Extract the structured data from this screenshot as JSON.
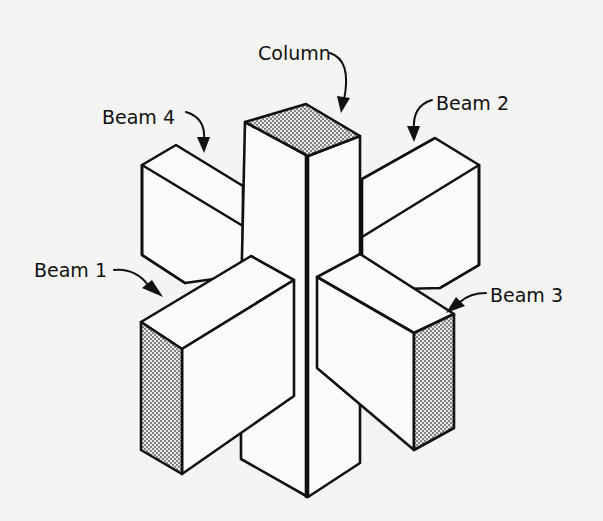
{
  "diagram": {
    "background": "#f4f4f2",
    "stroke_color": "#111111",
    "labels": {
      "column": "Column",
      "beam1": "Beam 1",
      "beam2": "Beam 2",
      "beam3": "Beam 3",
      "beam4": "Beam 4"
    },
    "components": [
      {
        "id": "column",
        "label": "Column",
        "shaded_face": "top"
      },
      {
        "id": "beam1",
        "label": "Beam 1",
        "shaded_face": "end (front-left)"
      },
      {
        "id": "beam2",
        "label": "Beam 2",
        "shaded_face": "none"
      },
      {
        "id": "beam3",
        "label": "Beam 3",
        "shaded_face": "end (front-right)"
      },
      {
        "id": "beam4",
        "label": "Beam 4",
        "shaded_face": "none"
      }
    ]
  }
}
